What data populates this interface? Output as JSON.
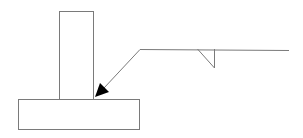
{
  "diagram": {
    "type": "fillet-weld-symbol-tee-joint",
    "colors": {
      "line": "#7a7a7a",
      "arrowhead": "#000000",
      "background": "#ffffff"
    },
    "parts": {
      "vertical_plate": {
        "x": 59,
        "y": 11,
        "w": 34,
        "h": 88
      },
      "base_plate": {
        "x": 18,
        "y": 99,
        "w": 121,
        "h": 30
      },
      "reference_line": {
        "x1": 140,
        "y1": 49,
        "x2": 289,
        "y2": 50
      },
      "leader_line": {
        "x1": 140,
        "y1": 49,
        "x2": 104,
        "y2": 88
      },
      "arrowhead": {
        "tip": [
          95,
          97
        ],
        "base1": [
          100,
          83
        ],
        "base2": [
          109,
          92
        ]
      },
      "fillet_symbol": {
        "p1": [
          197,
          49
        ],
        "p2": [
          214,
          68
        ],
        "p3": [
          214,
          49
        ]
      }
    }
  }
}
